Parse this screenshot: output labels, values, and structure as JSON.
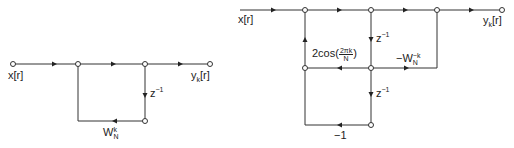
{
  "left_diagram": {
    "input_label": "x[r]",
    "output_label_main": "y",
    "output_label_sub": "k",
    "output_label_tail": "[r]",
    "delay_label_base": "z",
    "delay_label_exp": "−1",
    "feedback_gain_base": "W",
    "feedback_gain_sup": "k",
    "feedback_gain_sub": "N"
  },
  "right_diagram": {
    "input_label": "x[r]",
    "output_label_main": "y",
    "output_label_sub": "k",
    "output_label_tail": "[r]",
    "delay1_base": "z",
    "delay1_exp": "−1",
    "delay2_base": "z",
    "delay2_exp": "−1",
    "cos_gain_prefix": "2cos",
    "cos_gain_num": "2πk",
    "cos_gain_den": "N",
    "feedforward_gain_prefix": "−W",
    "feedforward_gain_sup": "−k",
    "feedforward_gain_sub": "N",
    "bottom_gain": "−1"
  }
}
